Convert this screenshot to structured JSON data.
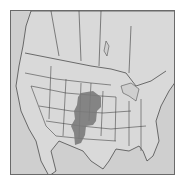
{
  "map": {
    "region": "North America (United States, southern Canada, northern Mexico)",
    "background_color": "#d4d4d4",
    "land_color": "#d8d8d8",
    "border_color": "#3a3a3a",
    "highlight_color": "#7a7a7a",
    "highlighted_range": "Central Great Plains (Nebraska, Kansas, eastern Colorado, western Oklahoma, Texas Panhandle, eastern New Mexico)"
  }
}
